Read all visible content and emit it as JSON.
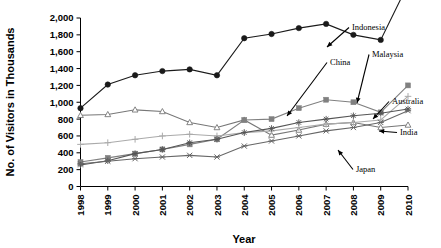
{
  "chart_data": {
    "type": "line",
    "title": "",
    "xlabel": "Year",
    "ylabel": "No. of Visitors in Thousands",
    "grid": false,
    "legend_position": "callout-annotations",
    "x": [
      1998,
      1999,
      2000,
      2001,
      2002,
      2003,
      2004,
      2005,
      2006,
      2007,
      2008,
      2009,
      2010
    ],
    "categories": [
      "1998",
      "1999",
      "2000",
      "2001",
      "2002",
      "2003",
      "2004",
      "2005",
      "2006",
      "2007",
      "2008",
      "2009",
      "2010"
    ],
    "ylim": [
      0,
      2000
    ],
    "ytick_labels": [
      "0",
      "200",
      "400",
      "600",
      "800",
      "1,000",
      "1,200",
      "1,400",
      "1,600",
      "1,800",
      "2,000"
    ],
    "ytick_values": [
      0,
      200,
      400,
      600,
      800,
      1000,
      1200,
      1400,
      1600,
      1800,
      2000
    ],
    "series": [
      {
        "name": "China",
        "marker": "filled-circle",
        "color": "#1a1a1a",
        "values": [
          930,
          1210,
          1320,
          1370,
          1390,
          1320,
          1760,
          1810,
          1880,
          1930,
          1800,
          1740,
          2400
        ]
      },
      {
        "name": "Japan",
        "marker": "open-triangle",
        "color": "#777777",
        "values": [
          845,
          855,
          910,
          890,
          760,
          700,
          790,
          610,
          670,
          740,
          760,
          700,
          730
        ]
      },
      {
        "name": "Malaysia",
        "marker": "filled-square",
        "color": "#808080",
        "values": [
          290,
          340,
          390,
          440,
          500,
          560,
          790,
          800,
          930,
          1030,
          1000,
          880,
          1200
        ]
      },
      {
        "name": "Australia",
        "marker": "plus",
        "color": "#aaaaaa",
        "values": [
          500,
          520,
          560,
          600,
          620,
          600,
          640,
          660,
          700,
          740,
          760,
          790,
          1070
        ]
      },
      {
        "name": "India",
        "marker": "star",
        "color": "#555555",
        "values": [
          255,
          305,
          390,
          440,
          520,
          560,
          640,
          690,
          760,
          800,
          840,
          870,
          920
        ]
      },
      {
        "name": "Asterisk",
        "marker": "x-mark",
        "color": "#666666",
        "values": [
          270,
          300,
          330,
          350,
          370,
          350,
          480,
          540,
          600,
          660,
          700,
          760,
          900
        ]
      }
    ],
    "annotations": [
      {
        "label": "Indonesia",
        "text_x": 352,
        "text_y": 30
      },
      {
        "label": "China",
        "text_x": 330,
        "text_y": 65
      },
      {
        "label": "Malaysia",
        "text_x": 372,
        "text_y": 57
      },
      {
        "label": "Australia",
        "text_x": 392,
        "text_y": 104
      },
      {
        "label": "India",
        "text_x": 400,
        "text_y": 135
      },
      {
        "label": "Japan",
        "text_x": 356,
        "text_y": 172
      }
    ]
  }
}
